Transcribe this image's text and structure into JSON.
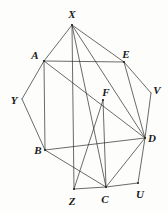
{
  "figure": {
    "kind": "geometry-diagram",
    "stroke_color": "#2b2b2b",
    "background_color": "#fdfdfc",
    "label_color": "#1a1a1a",
    "width": 168,
    "height": 213,
    "vertices": [
      {
        "id": "X",
        "label": "X",
        "x": 72,
        "y": 25,
        "label_x": 72,
        "label_y": 14
      },
      {
        "id": "A",
        "label": "A",
        "x": 44,
        "y": 61,
        "label_x": 35,
        "label_y": 55
      },
      {
        "id": "E",
        "label": "E",
        "x": 124,
        "y": 62,
        "label_x": 126,
        "label_y": 54
      },
      {
        "id": "V",
        "label": "V",
        "x": 151,
        "y": 93,
        "label_x": 157,
        "label_y": 90
      },
      {
        "id": "Y",
        "label": "Y",
        "x": 22,
        "y": 99,
        "label_x": 14,
        "label_y": 100
      },
      {
        "id": "F",
        "label": "F",
        "x": 103,
        "y": 100,
        "label_x": 106,
        "label_y": 92
      },
      {
        "id": "D",
        "label": "D",
        "x": 145,
        "y": 138,
        "label_x": 152,
        "label_y": 138
      },
      {
        "id": "B",
        "label": "B",
        "x": 45,
        "y": 150,
        "label_x": 38,
        "label_y": 150
      },
      {
        "id": "Z",
        "label": "Z",
        "x": 74,
        "y": 189,
        "label_x": 72,
        "label_y": 201
      },
      {
        "id": "C",
        "label": "C",
        "x": 106,
        "y": 187,
        "label_x": 105,
        "label_y": 199
      },
      {
        "id": "U",
        "label": "U",
        "x": 138,
        "y": 183,
        "label_x": 140,
        "label_y": 194
      }
    ],
    "edges": [
      {
        "from": "X",
        "to": "A"
      },
      {
        "from": "X",
        "to": "E"
      },
      {
        "from": "X",
        "to": "Z"
      },
      {
        "from": "X",
        "to": "C"
      },
      {
        "from": "X",
        "to": "D"
      },
      {
        "from": "A",
        "to": "E"
      },
      {
        "from": "A",
        "to": "Y"
      },
      {
        "from": "A",
        "to": "B"
      },
      {
        "from": "A",
        "to": "D"
      },
      {
        "from": "Y",
        "to": "B"
      },
      {
        "from": "E",
        "to": "V"
      },
      {
        "from": "E",
        "to": "D"
      },
      {
        "from": "V",
        "to": "D"
      },
      {
        "from": "F",
        "to": "C"
      },
      {
        "from": "F",
        "to": "Z"
      },
      {
        "from": "B",
        "to": "C"
      },
      {
        "from": "B",
        "to": "D"
      },
      {
        "from": "Z",
        "to": "C"
      },
      {
        "from": "C",
        "to": "U"
      },
      {
        "from": "C",
        "to": "D"
      },
      {
        "from": "U",
        "to": "D"
      }
    ],
    "marked_vertices": [
      "X",
      "A",
      "E",
      "F",
      "D",
      "B",
      "Z",
      "C",
      "U"
    ]
  }
}
